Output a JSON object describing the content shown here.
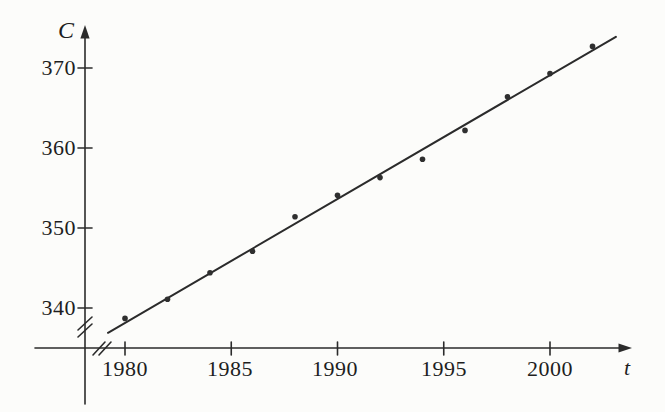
{
  "figure": {
    "background": "#fcfcfa",
    "ink_color": "#2b2b2b",
    "text_color": "#1e1e1e"
  },
  "chart_data": {
    "type": "scatter",
    "title": "",
    "xlabel": "t",
    "ylabel": "C",
    "x": [
      1980,
      1982,
      1984,
      1986,
      1988,
      1990,
      1992,
      1994,
      1996,
      1998,
      2000,
      2002
    ],
    "values": [
      338.7,
      341.1,
      344.4,
      347.1,
      351.4,
      354.1,
      356.3,
      358.6,
      362.2,
      366.4,
      369.3,
      372.7
    ],
    "trend_line": {
      "x_start": 1979.2,
      "y_start": 336.9,
      "x_end": 2003.1,
      "y_end": 373.9
    },
    "xticks": [
      1980,
      1985,
      1990,
      1995,
      2000
    ],
    "yticks": [
      340,
      350,
      360,
      370
    ],
    "xtick_labels": [
      "1980",
      "1985",
      "1990",
      "1995",
      "2000"
    ],
    "ytick_labels": [
      "340",
      "350",
      "360",
      "370"
    ],
    "xlim": [
      1977.5,
      2003.8
    ],
    "ylim": [
      333,
      375.5
    ],
    "grid": false,
    "legend": null,
    "axis_breaks": {
      "x_axis": true,
      "y_axis": true
    },
    "point_radius_px": 2.8
  }
}
